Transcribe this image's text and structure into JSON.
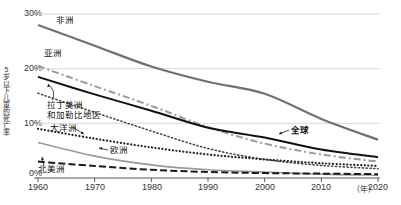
{
  "chart_data": {
    "type": "line",
    "title": "",
    "xlabel": "（年）",
    "ylabel": "5岁以下儿童的死亡率",
    "xlim": [
      1960,
      2020
    ],
    "ylim": [
      0,
      30
    ],
    "grid": true,
    "legend_position": "inline-annotations",
    "x": [
      1960,
      1970,
      1980,
      1990,
      2000,
      2010,
      2020
    ],
    "xticks": [
      "1960",
      "1970",
      "1980",
      "1990",
      "2000",
      "2010",
      "2020"
    ],
    "yticks": [
      "0%",
      "10%",
      "20%",
      "30%"
    ],
    "ytick_values": [
      0,
      10,
      20,
      30
    ],
    "series": [
      {
        "name": "非洲",
        "style": "solid",
        "color": "#707070",
        "width": 2.2,
        "values": [
          28.0,
          24.2,
          20.4,
          17.6,
          15.4,
          10.8,
          7.0
        ]
      },
      {
        "name": "亚洲",
        "style": "dash-dot",
        "color": "#9a9a9a",
        "width": 2.0,
        "values": [
          20.5,
          16.8,
          13.2,
          9.3,
          6.3,
          4.3,
          3.0
        ]
      },
      {
        "name": "全球",
        "style": "solid",
        "color": "#111111",
        "width": 2.0,
        "values": [
          18.5,
          15.3,
          12.3,
          9.2,
          7.4,
          5.2,
          3.8
        ]
      },
      {
        "name": "拉丁美洲和加勒比地区",
        "style": "dotted-fine",
        "color": "#4a4a4a",
        "width": 1.6,
        "values": [
          15.5,
          12.0,
          8.6,
          5.4,
          3.4,
          2.3,
          1.7
        ]
      },
      {
        "name": "大洋洲",
        "style": "dotted-bold",
        "color": "#222222",
        "width": 2.2,
        "values": [
          9.0,
          7.2,
          5.6,
          4.3,
          3.4,
          2.7,
          2.2
        ]
      },
      {
        "name": "欧洲",
        "style": "solid",
        "color": "#9a9a9a",
        "width": 1.6,
        "values": [
          6.5,
          4.0,
          2.4,
          1.5,
          1.1,
          0.7,
          0.5
        ]
      },
      {
        "name": "北美洲",
        "style": "long-dash",
        "color": "#1a1a1a",
        "width": 2.0,
        "values": [
          3.0,
          2.2,
          1.5,
          1.1,
          0.9,
          0.8,
          0.7
        ]
      }
    ],
    "annotations": [
      {
        "text": "非洲",
        "x": 56,
        "y": 16,
        "arrow": false
      },
      {
        "text": "亚洲",
        "x": 44,
        "y": 49,
        "arrow": false
      },
      {
        "text": "拉丁美洲",
        "x": 47,
        "y": 104,
        "arrow": true
      },
      {
        "text": "和加勒比地区",
        "x": 47,
        "y": 113,
        "arrow": false
      },
      {
        "text": "大洋洲",
        "x": 50,
        "y": 126,
        "arrow": true
      },
      {
        "text": "欧洲",
        "x": 104,
        "y": 150,
        "arrow": true
      },
      {
        "text": "北美洲",
        "x": 38,
        "y": 166,
        "arrow": true
      },
      {
        "text": "全球",
        "x": 285,
        "y": 128,
        "arrow": true
      }
    ]
  }
}
